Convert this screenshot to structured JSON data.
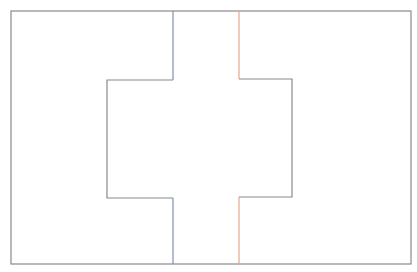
{
  "canvas": {
    "width": 417,
    "height": 272,
    "background": "#ffffff"
  },
  "colors": {
    "outline": "#8a8a8a",
    "left_channel": "#7f93b0",
    "right_channel": "#e8a68c"
  },
  "diagram": {
    "outer_frame": {
      "x1": 11,
      "y1": 11,
      "x2": 411,
      "y2": 264
    },
    "left_path": {
      "points": [
        [
          173,
          11
        ],
        [
          173,
          80
        ],
        [
          107,
          80
        ],
        [
          107,
          198
        ],
        [
          173,
          198
        ],
        [
          173,
          264
        ]
      ]
    },
    "right_path": {
      "points": [
        [
          239,
          11
        ],
        [
          239,
          79
        ],
        [
          292,
          79
        ],
        [
          292,
          197
        ],
        [
          239,
          197
        ],
        [
          239,
          264
        ]
      ]
    }
  }
}
